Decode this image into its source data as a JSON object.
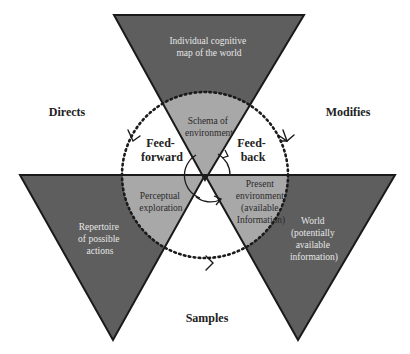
{
  "diagram": {
    "colors": {
      "background": "#ffffff",
      "dark_fill": "#5e5e5e",
      "light_fill": "#a8a8a8",
      "outline": "#1a1a1a",
      "dark_text": "#e6e6e6",
      "light_text": "#2a2a2a",
      "bold_text": "#222222"
    },
    "outer_triangles": {
      "top": {
        "lines": [
          "Individual cognitive",
          "map of the world"
        ]
      },
      "left": {
        "lines": [
          "Repertoire",
          "of possible",
          "actions"
        ]
      },
      "right": {
        "lines": [
          "World",
          "(potentially",
          "available",
          "information)"
        ]
      }
    },
    "inner_wedges": {
      "top": {
        "lines": [
          "Schema of",
          "environment"
        ]
      },
      "left": {
        "lines": [
          "Perceptual",
          "exploration"
        ]
      },
      "right": {
        "lines": [
          "Present",
          "environment",
          "(available",
          "Information)"
        ]
      }
    },
    "inner_labels": {
      "feedforward": [
        "Feed-",
        "forward"
      ],
      "feedback": [
        "Feed-",
        "back"
      ]
    },
    "relations": {
      "directs": "Directs",
      "modifies": "Modifies",
      "samples": "Samples"
    }
  }
}
